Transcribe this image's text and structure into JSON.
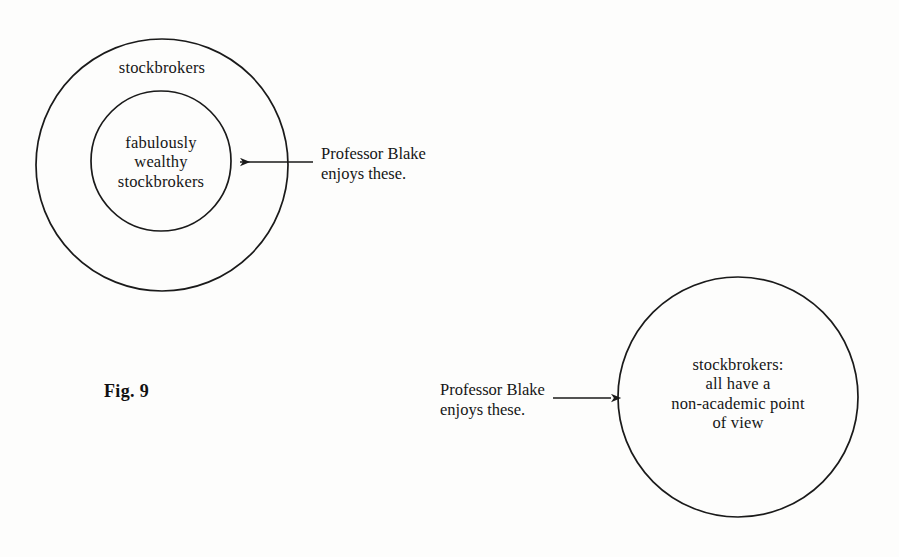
{
  "figure": {
    "caption": "Fig. 9",
    "background_color": "#fdfdfc",
    "stroke_color": "#1a1a1a"
  },
  "diagram_left": {
    "name": "nested-set-venn",
    "outer_circle": {
      "label": "stockbrokers",
      "cx": 162,
      "cy": 165,
      "r": 126
    },
    "inner_circle": {
      "label": "fabulously\nwealthy\nstockbrokers",
      "cx": 161,
      "cy": 161,
      "r": 70
    },
    "annotation": {
      "text": "Professor Blake\nenjoys these.",
      "arrow_direction": "left",
      "arrow_from_x": 313,
      "arrow_to_x": 231,
      "arrow_y": 162
    }
  },
  "diagram_right": {
    "name": "single-set-circle",
    "circle": {
      "label": "stockbrokers:\nall have a\nnon-academic point\nof view",
      "cx": 738,
      "cy": 397,
      "r": 120
    },
    "annotation": {
      "text": "Professor Blake\nenjoys these.",
      "arrow_direction": "right",
      "arrow_from_x": 553,
      "arrow_to_x": 619,
      "arrow_y": 398
    }
  }
}
